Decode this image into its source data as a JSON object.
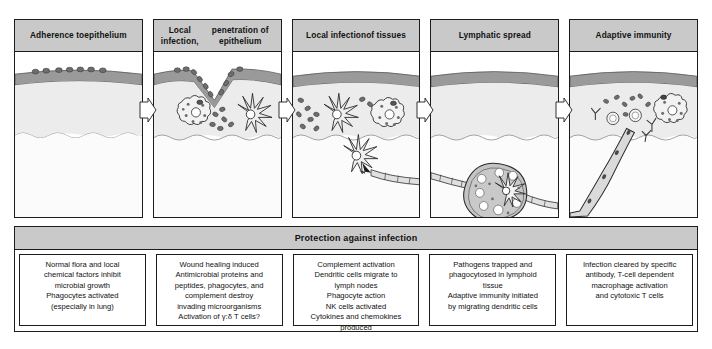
{
  "figure": {
    "stages": [
      {
        "id": "adherence",
        "title": "Adherence to\nepithelium",
        "title_line1": "Adherence to",
        "title_line2": "epithelium",
        "art_name": "epithelium-adherence-illustration"
      },
      {
        "id": "local-infection-penetration",
        "title_line1": "Local infection,",
        "title_line2": "penetration of epithelium",
        "art_name": "epithelium-penetration-illustration"
      },
      {
        "id": "local-infection-tissues",
        "title_line1": "Local infection",
        "title_line2": "of tissues",
        "art_name": "tissue-infection-illustration"
      },
      {
        "id": "lymphatic-spread",
        "title_line1": "Lymphatic spread",
        "title_line2": "",
        "art_name": "lymph-node-illustration"
      },
      {
        "id": "adaptive-immunity",
        "title_line1": "Adaptive immunity",
        "title_line2": "",
        "art_name": "adaptive-immunity-illustration"
      }
    ],
    "protection": {
      "title": "Protection against infection",
      "cells": [
        {
          "id": "protection-adherence",
          "lines": [
            "Normal flora and local",
            "chemical factors inhibit",
            "microbial growth",
            "Phagocytes activated",
            "(especially in lung)"
          ]
        },
        {
          "id": "protection-penetration",
          "lines": [
            "Wound healing induced",
            "Antimicrobial proteins and",
            "peptides, phagocytes, and",
            "complement destroy",
            "invading microorganisms",
            "Activation of γ:δ T cells?"
          ]
        },
        {
          "id": "protection-tissues",
          "lines": [
            "Complement activation",
            "Dendritic cells migrate to",
            "lymph nodes",
            "Phagocyte action",
            "NK cells activated",
            "Cytokines and chemokines",
            "produced"
          ]
        },
        {
          "id": "protection-lymphatic",
          "lines": [
            "Pathogens trapped and",
            "phagocytosed in lymphoid",
            "tissue",
            "Adaptive immunity initiated",
            "by migrating dendritic cells"
          ]
        },
        {
          "id": "protection-adaptive",
          "lines": [
            "Infection cleared by specific",
            "antibody, T-cell dependent",
            "macrophage activation",
            "and cytotoxic T cells"
          ]
        }
      ]
    },
    "colors": {
      "header_fill": "#c9c9c9",
      "outline": "#1c1c1c",
      "epithelium_band": "#9a9a9a",
      "tissue_fill": "#ececec",
      "deep_fill": "#f7f7f7",
      "pathogen_fill": "#707070",
      "lymph_node_fill": "#c4c4c4",
      "vessel_fill": "#d8d8d8"
    }
  }
}
